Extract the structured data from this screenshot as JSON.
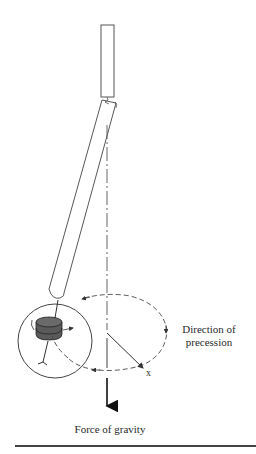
{
  "figure": {
    "type": "physics-diagram",
    "labels": {
      "precession": "Direction of precession",
      "gravity": "Force of gravity",
      "axis_marker": "x"
    },
    "colors": {
      "stroke": "#333333",
      "disk_fill": "#5a5a5a",
      "text": "#2a2a2a"
    }
  }
}
